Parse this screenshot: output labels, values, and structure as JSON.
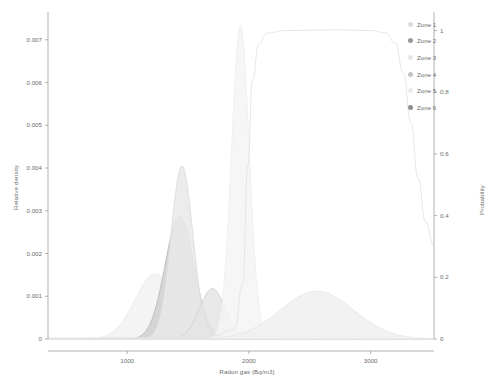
{
  "chart_data": {
    "type": "area",
    "title": "",
    "subtitle": "",
    "xlabel": "Radon gas (Bq/m3)",
    "ylabel": "Relative density",
    "y2label": "Probability",
    "xlim": [
      350,
      3520
    ],
    "ylim": [
      0,
      0.00765
    ],
    "y2lim": [
      0,
      1.06
    ],
    "grid": false,
    "legend_position": "top-right",
    "xticks": [
      1000,
      2000,
      3000
    ],
    "xticklabels": [
      "1000",
      "2000",
      "3000"
    ],
    "yticks": [
      0,
      0.001,
      0.002,
      0.003,
      0.004,
      0.005,
      0.006,
      0.007
    ],
    "yticklabels": [
      "0",
      "0.001",
      "0.002",
      "0.003",
      "0.004",
      "0.005",
      "0.006",
      "0.007"
    ],
    "y2ticks": [
      0,
      0.2,
      0.4,
      0.6,
      0.8,
      1
    ],
    "y2ticklabels": [
      "0",
      "0.2",
      "0.4",
      "0.6",
      "0.8",
      "1"
    ],
    "series": [
      {
        "name": "Zone 1",
        "kind": "density",
        "peak_x": 1230,
        "peak_y": 0.00152,
        "sigma": 165,
        "color": "#e8e8e8",
        "fill": "#f2f2f2",
        "axis": "left"
      },
      {
        "name": "Zone 2",
        "kind": "density",
        "peak_x": 1430,
        "peak_y": 0.00288,
        "sigma": 118,
        "color": "#b8b8b8",
        "fill": "#cfcfcf",
        "axis": "left"
      },
      {
        "name": "Zone 3",
        "kind": "density",
        "peak_x": 1450,
        "peak_y": 0.00405,
        "sigma": 90,
        "color": "#dadada",
        "fill": "#e9e9e9",
        "axis": "left"
      },
      {
        "name": "Zone 4",
        "kind": "density",
        "peak_x": 1700,
        "peak_y": 0.00118,
        "sigma": 105,
        "color": "#cfcfcf",
        "fill": "#e4e4e4",
        "axis": "left"
      },
      {
        "name": "Zone 5",
        "kind": "density",
        "peak_x": 1930,
        "peak_y": 0.00735,
        "sigma": 72,
        "color": "#ededed",
        "fill": "#f5f5f5",
        "axis": "left"
      },
      {
        "name": "Zone 6",
        "kind": "density",
        "peak_x": 2560,
        "peak_y": 0.00112,
        "sigma": 300,
        "color": "#e4e4e4",
        "fill": "#f0f0f0",
        "axis": "left"
      }
    ],
    "probability_curve": {
      "name": "probability",
      "kind": "cdf",
      "color": "#e3e3e3",
      "axis": "right",
      "points": [
        [
          350,
          0.003
        ],
        [
          900,
          0.004
        ],
        [
          1400,
          0.006
        ],
        [
          1700,
          0.01
        ],
        [
          1880,
          0.03
        ],
        [
          1950,
          0.18
        ],
        [
          1990,
          0.56
        ],
        [
          2030,
          0.84
        ],
        [
          2080,
          0.955
        ],
        [
          2150,
          0.992
        ],
        [
          2300,
          1.0
        ],
        [
          2700,
          1.002
        ],
        [
          3000,
          1.0
        ],
        [
          3120,
          0.993
        ],
        [
          3200,
          0.96
        ],
        [
          3270,
          0.86
        ],
        [
          3330,
          0.7
        ],
        [
          3390,
          0.52
        ],
        [
          3450,
          0.38
        ],
        [
          3520,
          0.3
        ]
      ]
    }
  },
  "legend": {
    "items": [
      {
        "label": "Zone 1",
        "color": "#dcdcdc"
      },
      {
        "label": "Zone 2",
        "color": "#9a9a9a"
      },
      {
        "label": "Zone 3",
        "color": "#e6e6e6"
      },
      {
        "label": "Zone 4",
        "color": "#c4c4c4"
      },
      {
        "label": "Zone 5",
        "color": "#ececec"
      },
      {
        "label": "Zone 6",
        "color": "#8f8f8f"
      }
    ]
  },
  "axes": {
    "left_title": "Relative density",
    "right_title": "Probability",
    "x_title": "Radon gas (Bq/m3)"
  }
}
